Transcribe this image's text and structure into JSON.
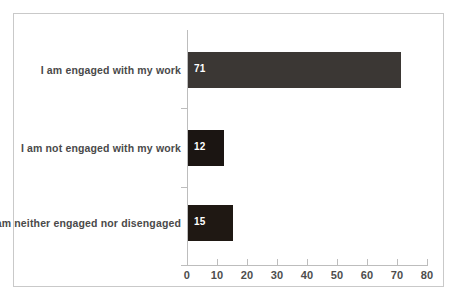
{
  "chart_data": {
    "type": "bar",
    "orientation": "horizontal",
    "title": "",
    "subtitle": "",
    "xlabel": "",
    "ylabel": "",
    "categories": [
      "I am engaged with my work",
      "I am not engaged with my work",
      "I am neither engaged nor disengaged"
    ],
    "values": [
      71,
      12,
      15
    ],
    "data_labels": [
      "71",
      "12",
      "15"
    ],
    "bar_colors": [
      "#3b3734",
      "#1b1512",
      "#1f1813"
    ],
    "xlim": [
      0,
      80
    ],
    "xticks": [
      0,
      10,
      20,
      30,
      40,
      50,
      60,
      70,
      80
    ],
    "xtick_labels": [
      "0",
      "10",
      "20",
      "30",
      "40",
      "50",
      "60",
      "70",
      "80"
    ],
    "grid": false,
    "legend": false,
    "legend_position": "none",
    "axis_color": "#bdbdbd",
    "label_color": "#4a4a4a",
    "data_label_color": "#ffffff",
    "background_color": "#ffffff",
    "frame_color": "#c9c9c9"
  }
}
